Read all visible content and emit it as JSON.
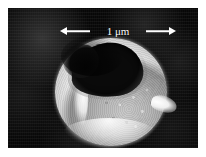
{
  "figure": {
    "type": "sem-micrograph",
    "background_color": "#070707",
    "particle_color": "#f2f2f2",
    "frame": {
      "margin_color": "#ffffff"
    }
  },
  "scale_bar": {
    "label": "1 μm",
    "value": "1",
    "unit": "μm",
    "arrow_style": "double-headed",
    "color": "#ffffff"
  }
}
